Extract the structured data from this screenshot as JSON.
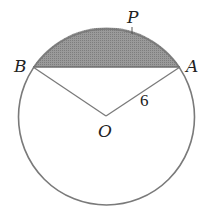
{
  "diagram": {
    "type": "circle-segment",
    "circle": {
      "center_label": "O",
      "radius_label": "6"
    },
    "points": {
      "A": {
        "label": "A"
      },
      "B": {
        "label": "B"
      },
      "O": {
        "label": "O"
      },
      "P": {
        "label": "P"
      }
    },
    "shaded_region": "minor segment between chord BA and arc BPA",
    "colors": {
      "stroke": "#7a7a7a",
      "shade": "#8f8f8f",
      "text": "#222222"
    }
  }
}
